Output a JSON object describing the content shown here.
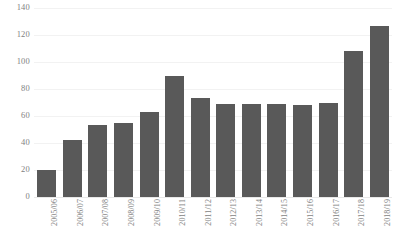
{
  "chart_data": {
    "type": "bar",
    "title": "",
    "subtitle": "",
    "xlabel": "",
    "ylabel": "",
    "ylim": [
      0,
      140
    ],
    "ytick_step": 20,
    "yticks": [
      0,
      20,
      40,
      60,
      80,
      100,
      120,
      140
    ],
    "ytick_labels": [
      "0",
      "20",
      "40",
      "60",
      "80",
      "100",
      "120",
      "140"
    ],
    "grid": true,
    "grid_axis": "y",
    "legend": false,
    "legend_position": "none",
    "categories": [
      "2005/06",
      "2006/07",
      "2007/08",
      "2008/09",
      "2009/10",
      "2010/11",
      "2011/12",
      "2012/13",
      "2013/14",
      "2014/15",
      "2015/16",
      "2016/17",
      "2017/18",
      "2018/19"
    ],
    "values": [
      20,
      42,
      53,
      55,
      63,
      90,
      73,
      69,
      69,
      69,
      68,
      70,
      108,
      127
    ],
    "xtick_rotation": -90,
    "bar_color": "#595959",
    "background_color": "#ffffff",
    "gridline_color": "#f2f2f2",
    "axis_label_color": "#7f7f7f"
  }
}
